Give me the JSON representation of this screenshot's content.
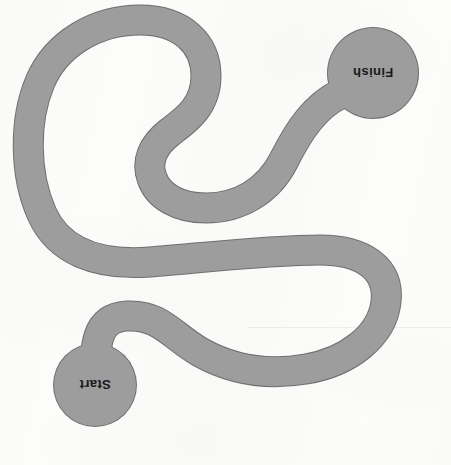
{
  "page": {
    "type": "maze-path-puzzle",
    "orientation": "upside-down",
    "background_color": "#fcfcfb"
  },
  "maze": {
    "path_fill_color": "#9d9d9d",
    "path_outline_color": "#6f6f6f",
    "path_stroke_width": 29,
    "endpoints": [
      {
        "id": "start",
        "label": "Start",
        "center_x": 95,
        "center_y": 385,
        "radius": 41,
        "rotation_degrees": 180
      },
      {
        "id": "finish",
        "label": "Finish",
        "center_x": 373,
        "center_y": 73,
        "radius": 45,
        "rotation_degrees": 180
      }
    ],
    "path_d": "M 95 385 C 95 345 95 318 127 316 C 160 314 172 336 200 352 C 232 370 266 376 306 369 C 348 362 382 336 386 302 C 390 268 362 250 320 250 C 270 250 200 258 150 262 C 96 266 58 250 42 214 C 24 174 24 120 40 82 C 56 44 96 20 140 20 C 182 20 206 44 206 76 C 206 106 186 120 170 132 C 152 146 146 162 152 178 C 158 196 178 208 206 208 C 238 208 268 192 284 160 C 300 128 316 106 340 94 L 373 73"
  },
  "labels": {
    "finish_text": "Finish",
    "start_text": "Start"
  }
}
